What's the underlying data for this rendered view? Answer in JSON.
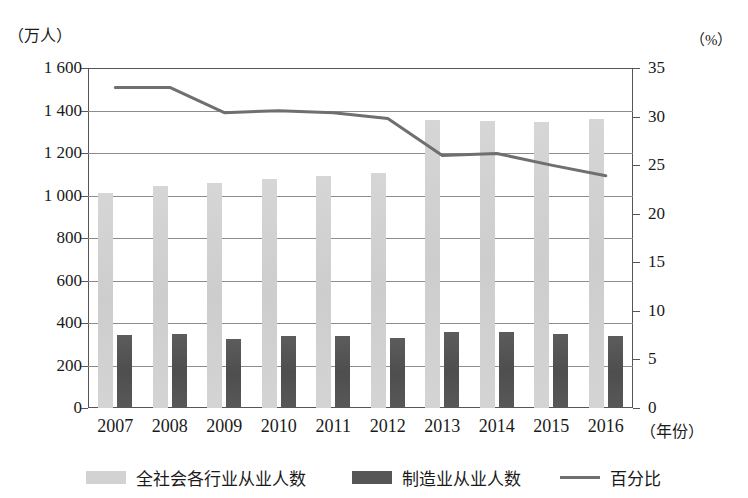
{
  "chart_data": {
    "type": "bar",
    "title": "",
    "xlabel": "（年份）",
    "left_axis_unit": "（万人）",
    "right_axis_unit": "（%）",
    "categories": [
      "2007",
      "2008",
      "2009",
      "2010",
      "2011",
      "2012",
      "2013",
      "2014",
      "2015",
      "2016"
    ],
    "series": [
      {
        "name": "全社会各行业从业人数",
        "kind": "bar",
        "axis": "left",
        "color": "#d2d2d2",
        "values": [
          1010,
          1045,
          1060,
          1080,
          1090,
          1105,
          1355,
          1350,
          1345,
          1360
        ]
      },
      {
        "name": "制造业从业人数",
        "kind": "bar",
        "axis": "left",
        "color": "#565656",
        "values": [
          345,
          350,
          325,
          340,
          337,
          330,
          360,
          360,
          350,
          338
        ]
      },
      {
        "name": "百分比",
        "kind": "line",
        "axis": "right",
        "color": "#6f6f6f",
        "values": [
          33.0,
          33.0,
          30.4,
          30.6,
          30.4,
          29.8,
          26.0,
          26.2,
          25.0,
          23.9
        ]
      }
    ],
    "left_axis": {
      "label": "万人",
      "ticks": [
        "0",
        "200",
        "400",
        "600",
        "800",
        "1 000",
        "1 200",
        "1 400",
        "1 600"
      ],
      "tick_values": [
        0,
        200,
        400,
        600,
        800,
        1000,
        1200,
        1400,
        1600
      ],
      "ylim": [
        0,
        1600
      ]
    },
    "right_axis": {
      "label": "%",
      "ticks": [
        "0",
        "5",
        "10",
        "15",
        "20",
        "25",
        "30",
        "35"
      ],
      "tick_values": [
        0,
        5,
        10,
        15,
        20,
        25,
        30,
        35
      ],
      "ylim": [
        0,
        35
      ]
    },
    "grid": true,
    "legend_position": "bottom"
  },
  "legend": {
    "items": [
      {
        "label": "全社会各行业从业人数",
        "swatch": "light"
      },
      {
        "label": "制造业从业人数",
        "swatch": "dark"
      },
      {
        "label": "百分比",
        "swatch": "line"
      }
    ]
  }
}
